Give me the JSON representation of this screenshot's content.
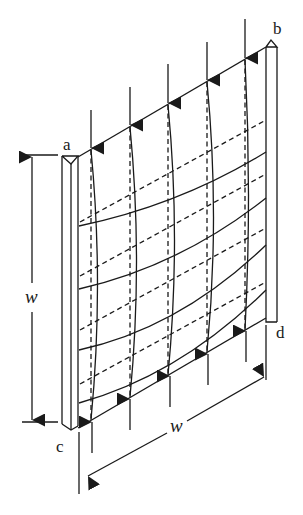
{
  "diagram": {
    "colors": {
      "line": "#1a1a1a",
      "background": "#ffffff"
    },
    "corner_labels": {
      "a": "a",
      "b": "b",
      "c": "c",
      "d": "d"
    },
    "dimensions": {
      "vertical": {
        "label": "w"
      },
      "horizontal": {
        "label": "w"
      }
    },
    "loads": {
      "top_arrow_count": 5,
      "top_arrow_direction": "down",
      "bottom_arrow_count": 5,
      "bottom_arrow_direction": "up"
    },
    "mode_shape": {
      "solid_curves_horizontal": 4,
      "dashed_lines_horizontal": 4,
      "solid_curves_vertical": 5,
      "dashed_lines_vertical": 5
    }
  }
}
